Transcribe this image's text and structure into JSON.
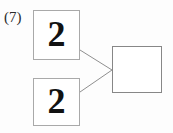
{
  "canvas": {
    "width": 173,
    "height": 133,
    "background": "#fdfdfd"
  },
  "problem": {
    "number_label": "(7)"
  },
  "colors": {
    "addend_border": "#a9a9a9",
    "sum_border": "#878787",
    "connector_line": "#8f8f8f",
    "digit": "#121212",
    "label_text": "#2b2b2b"
  },
  "diagram": {
    "type": "number-bond",
    "addends": [
      {
        "name": "addend-1",
        "value": "2"
      },
      {
        "name": "addend-2",
        "value": "2"
      }
    ],
    "sum": {
      "name": "sum",
      "value": ""
    },
    "connectors": [
      {
        "from": "addend-1",
        "to": "sum",
        "x1": 80,
        "y1": 50,
        "x2": 112,
        "y2": 70
      },
      {
        "from": "addend-2",
        "to": "sum",
        "x1": 80,
        "y1": 92,
        "x2": 112,
        "y2": 70
      }
    ]
  }
}
